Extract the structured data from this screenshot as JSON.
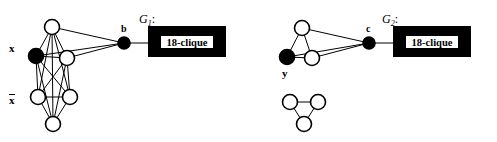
{
  "figure": {
    "width": 497,
    "height": 142,
    "background": "#ffffff",
    "ink_color": "#000000",
    "node_fill_white": "#ffffff",
    "node_fill_black": "#000000"
  },
  "graphs": [
    {
      "id": "G1",
      "label": "G",
      "label_sub": "1",
      "label_colon": ":",
      "label_pos": {
        "x": 139,
        "y": 13
      },
      "variable_labels": [
        {
          "name": "x",
          "text": "x",
          "overbar": false,
          "x": 9,
          "y": 43
        },
        {
          "name": "x-bar",
          "text": "x",
          "overbar": true,
          "x": 9,
          "y": 94
        }
      ],
      "connector_node": {
        "name": "b",
        "label": "b",
        "label_x": 121,
        "label_y": 24,
        "cx": 124,
        "cy": 43,
        "r": 6,
        "fill": "#000000"
      },
      "nodes": [
        {
          "id": "n1",
          "cx": 52,
          "cy": 27,
          "r": 7.5,
          "fill": "#ffffff"
        },
        {
          "id": "n2",
          "cx": 36,
          "cy": 56,
          "r": 7.5,
          "fill": "#000000"
        },
        {
          "id": "n3",
          "cx": 67,
          "cy": 58,
          "r": 7.5,
          "fill": "#ffffff"
        },
        {
          "id": "n4",
          "cx": 38,
          "cy": 97,
          "r": 7.5,
          "fill": "#ffffff"
        },
        {
          "id": "n5",
          "cx": 70,
          "cy": 97,
          "r": 7.5,
          "fill": "#ffffff"
        },
        {
          "id": "n6",
          "cx": 53,
          "cy": 124,
          "r": 7.5,
          "fill": "#ffffff"
        }
      ],
      "edges": [
        [
          "n1",
          "n2"
        ],
        [
          "n1",
          "n3"
        ],
        [
          "n1",
          "n4"
        ],
        [
          "n1",
          "n5"
        ],
        [
          "n1",
          "n6"
        ],
        [
          "n2",
          "n3"
        ],
        [
          "n2",
          "n4"
        ],
        [
          "n2",
          "n5"
        ],
        [
          "n2",
          "n6"
        ],
        [
          "n3",
          "n4"
        ],
        [
          "n3",
          "n5"
        ],
        [
          "n3",
          "n6"
        ],
        [
          "n4",
          "n5"
        ],
        [
          "n4",
          "n6"
        ],
        [
          "n5",
          "n6"
        ]
      ],
      "connector_edges": [
        [
          "n1",
          "b"
        ],
        [
          "n2",
          "b"
        ],
        [
          "n3",
          "b"
        ]
      ],
      "box": {
        "name": "clique-box-g1",
        "x": 148,
        "y": 26,
        "w": 78,
        "h": 31,
        "inner": {
          "x": 12,
          "y": 9,
          "w": 54,
          "h": 14
        },
        "label": "18-clique",
        "stem": {
          "x1": 124,
          "y1": 43,
          "x2": 148,
          "y2": 43
        }
      }
    },
    {
      "id": "G2",
      "label": "G",
      "label_sub": "2",
      "label_colon": ":",
      "label_pos": {
        "x": 382,
        "y": 13
      },
      "variable_labels": [
        {
          "name": "y",
          "text": "y",
          "overbar": false,
          "x": 282,
          "y": 68
        }
      ],
      "connector_node": {
        "name": "c",
        "label": "c",
        "label_x": 366,
        "label_y": 24,
        "cx": 369,
        "cy": 43,
        "r": 6,
        "fill": "#000000"
      },
      "nodes": [
        {
          "id": "m1",
          "cx": 302,
          "cy": 28,
          "r": 7.5,
          "fill": "#ffffff"
        },
        {
          "id": "m2",
          "cx": 287,
          "cy": 57,
          "r": 7.5,
          "fill": "#000000"
        },
        {
          "id": "m3",
          "cx": 312,
          "cy": 58,
          "r": 7.5,
          "fill": "#ffffff"
        }
      ],
      "edges": [
        [
          "m1",
          "m2"
        ],
        [
          "m1",
          "m3"
        ],
        [
          "m2",
          "m3"
        ]
      ],
      "connector_edges": [
        [
          "m1",
          "c"
        ],
        [
          "m2",
          "c"
        ],
        [
          "m3",
          "c"
        ]
      ],
      "extra_component": {
        "name": "isolated-triangle",
        "nodes": [
          {
            "id": "p1",
            "cx": 290,
            "cy": 102,
            "r": 7.5,
            "fill": "#ffffff"
          },
          {
            "id": "p2",
            "cx": 318,
            "cy": 102,
            "r": 7.5,
            "fill": "#ffffff"
          },
          {
            "id": "p3",
            "cx": 304,
            "cy": 124,
            "r": 7.5,
            "fill": "#ffffff"
          }
        ],
        "edges": [
          [
            "p1",
            "p2"
          ],
          [
            "p1",
            "p3"
          ],
          [
            "p2",
            "p3"
          ]
        ]
      },
      "box": {
        "name": "clique-box-g2",
        "x": 393,
        "y": 26,
        "w": 78,
        "h": 31,
        "inner": {
          "x": 12,
          "y": 9,
          "w": 54,
          "h": 14
        },
        "label": "18-clique",
        "stem": {
          "x1": 369,
          "y1": 43,
          "x2": 393,
          "y2": 43
        }
      }
    }
  ]
}
